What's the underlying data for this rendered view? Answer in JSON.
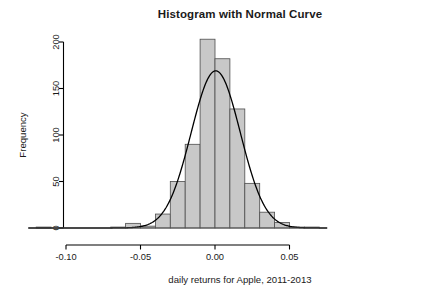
{
  "figure": {
    "title": "Histogram with Normal Curve",
    "xlabel": "daily returns for Apple, 2011-2013",
    "ylabel": "Frequency",
    "background_color": "#ffffff",
    "bar_fill_color": "#c8c8c8",
    "bar_border_color": "#4d4d4d",
    "curve_color": "#000000",
    "axis_color": "#000000",
    "text_color": "#1a1a1a"
  },
  "axes": {
    "x_tick_labels": [
      "-0.10",
      "-0.05",
      "0.00",
      "0.05"
    ],
    "x_tick_values": [
      -0.1,
      -0.05,
      0.0,
      0.05
    ],
    "y_tick_labels": [
      "0",
      "50",
      "100",
      "150",
      "200"
    ],
    "y_tick_values": [
      0,
      50,
      100,
      150,
      200
    ]
  },
  "chart_data": {
    "type": "bar",
    "title": "Histogram with Normal Curve",
    "subtitle": "",
    "xlabel": "daily returns for Apple, 2011-2013",
    "ylabel": "Frequency",
    "xlim": [
      -0.125,
      0.075
    ],
    "ylim": [
      0,
      210
    ],
    "grid": false,
    "legend": null,
    "bin_width": 0.01,
    "bin_edges": [
      -0.12,
      -0.11,
      -0.1,
      -0.09,
      -0.08,
      -0.07,
      -0.06,
      -0.05,
      -0.04,
      -0.03,
      -0.02,
      -0.01,
      0.0,
      0.01,
      0.02,
      0.03,
      0.04,
      0.05,
      0.06,
      0.07
    ],
    "bin_centers": [
      -0.115,
      -0.105,
      -0.095,
      -0.085,
      -0.075,
      -0.065,
      -0.055,
      -0.045,
      -0.035,
      -0.025,
      -0.015,
      -0.005,
      0.005,
      0.015,
      0.025,
      0.035,
      0.045,
      0.055,
      0.065
    ],
    "categories": [
      "-0.115",
      "-0.105",
      "-0.095",
      "-0.085",
      "-0.075",
      "-0.065",
      "-0.055",
      "-0.045",
      "-0.035",
      "-0.025",
      "-0.015",
      "-0.005",
      "0.005",
      "0.015",
      "0.025",
      "0.035",
      "0.045",
      "0.055",
      "0.065"
    ],
    "values": [
      1,
      0,
      0,
      0,
      0,
      1,
      5,
      2,
      15,
      50,
      90,
      203,
      182,
      128,
      48,
      17,
      6,
      1,
      1
    ],
    "series": [
      {
        "name": "Frequency",
        "type": "bar",
        "values": [
          1,
          0,
          0,
          0,
          0,
          1,
          5,
          2,
          15,
          50,
          90,
          203,
          182,
          128,
          48,
          17,
          6,
          1,
          1
        ]
      },
      {
        "name": "Normal curve",
        "type": "line",
        "distribution": "normal",
        "mean": 0.0005,
        "sd": 0.0165,
        "peak_value": 169
      }
    ]
  }
}
